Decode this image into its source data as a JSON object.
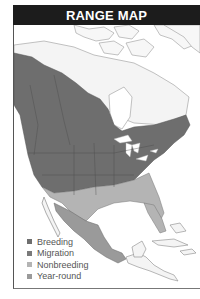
{
  "header": {
    "title": "RANGE MAP"
  },
  "map": {
    "region": "North and Central America",
    "colors": {
      "breeding": "#6e6e6e",
      "migration": "#7a7a7a",
      "nonbreeding": "#b4b4b4",
      "year_round": "#9a9a9a",
      "land_outline": "#888888",
      "water": "#ffffff",
      "land_out_of_range": "#f4f4f4"
    }
  },
  "legend": {
    "items": [
      {
        "label": "Breeding",
        "color": "#6e6e6e"
      },
      {
        "label": "Migration",
        "color": "#7a7a7a"
      },
      {
        "label": "Nonbreeding",
        "color": "#b4b4b4"
      },
      {
        "label": "Year-round",
        "color": "#9a9a9a"
      }
    ]
  }
}
